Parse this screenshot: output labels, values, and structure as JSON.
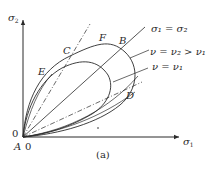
{
  "figure": {
    "caption": "(a)",
    "axes": {
      "x_label": "σ",
      "x_sub": "1",
      "y_label": "σ",
      "y_sub": "2",
      "origin_x_tick": "0",
      "origin_y_tick": "0",
      "origin_point": "A"
    },
    "points": {
      "A": "A",
      "B": "B",
      "C": "C",
      "D": "D",
      "E": "E",
      "F": "F"
    },
    "legend": {
      "equal_line": "σ₁ = σ₂",
      "curve_outer": "ν = ν₂ > ν₁",
      "curve_inner": "ν = ν₁"
    },
    "colors": {
      "line": "#2a2a2a",
      "background": "#ffffff"
    }
  }
}
